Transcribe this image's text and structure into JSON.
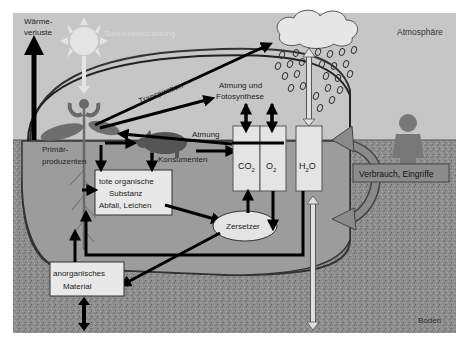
{
  "diagram": {
    "regions": {
      "atmosphere": "Atmosphäre",
      "soil": "Boden"
    },
    "labels": {
      "heat_loss_line1": "Wärme-",
      "heat_loss_line2": "verluste",
      "solar_radiation": "Sonneneinstrahlung",
      "transpiration": "Transpiration",
      "respiration_photosynthesis_line1": "Atmung und",
      "respiration_photosynthesis_line2": "Fotosynthese",
      "respiration": "Atmung",
      "producers_line1": "Primär-",
      "producers_line2": "produzenten",
      "consumers": "Konsumenten",
      "decomposers": "Zersetzer"
    },
    "boxes": {
      "dead_matter_line1": "tote organische",
      "dead_matter_line2": "Substanz",
      "dead_matter_line3": "Abfall, Leichen",
      "inorganic_line1": "anorganisches",
      "inorganic_line2": "Material",
      "co2": "CO",
      "co2_sub": "2",
      "o2": "O",
      "o2_sub": "2",
      "h2o_h": "H",
      "h2o_sub": "2",
      "h2o_o": "O",
      "human_use": "Verbrauch, Eingriffe"
    },
    "colors": {
      "atmosphere": "#c6c6c6",
      "soil": "#8a8a8a",
      "ecosystem_fill": "#a9a9a9",
      "box_fill": "#e6e6e6",
      "arrow": "#000000",
      "sun": "#e8e8e8",
      "organism": "#6e6e6e"
    }
  }
}
